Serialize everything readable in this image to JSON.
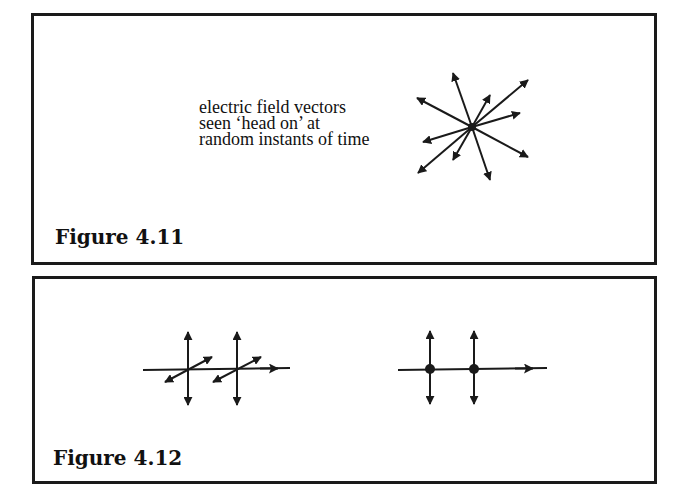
{
  "figures": [
    {
      "id": "4.11",
      "caption": "Figure 4.11",
      "annotation": {
        "lines": [
          "electric field vectors",
          "seen ‘head on’ at",
          "random instants of time"
        ]
      },
      "diagram": {
        "type": "radial-vectors",
        "center": [
          472,
          127
        ],
        "arrow_tips": [
          [
            453,
            73
          ],
          [
            528,
            80
          ],
          [
            417,
            98
          ],
          [
            490,
            95
          ],
          [
            520,
            113
          ],
          [
            423,
            142
          ],
          [
            453,
            160
          ],
          [
            528,
            157
          ],
          [
            418,
            173
          ],
          [
            490,
            180
          ]
        ]
      }
    },
    {
      "id": "4.12",
      "caption": "Figure 4.12",
      "diagram_left": {
        "type": "propagation-with-two-polarizations",
        "axis": {
          "from": [
            143,
            370
          ],
          "to": [
            290,
            368
          ]
        },
        "vertical_vectors_x": [
          188,
          237
        ],
        "vertical_range": [
          332,
          405
        ],
        "diagonal_vectors": [
          {
            "from": [
              165,
              382
            ],
            "to": [
              212,
              357
            ]
          },
          {
            "from": [
              213,
              382
            ],
            "to": [
              261,
              357
            ]
          }
        ]
      },
      "diagram_right": {
        "type": "propagation-with-dot-notation",
        "axis": {
          "from": [
            398,
            370
          ],
          "to": [
            547,
            368
          ]
        },
        "vertical_vectors_x": [
          430,
          474
        ],
        "vertical_range": [
          331,
          404
        ],
        "dots": [
          [
            430,
            369
          ],
          [
            474,
            369
          ]
        ]
      }
    }
  ],
  "colors": {
    "ink": "#1a1a1a",
    "background": "#ffffff"
  }
}
